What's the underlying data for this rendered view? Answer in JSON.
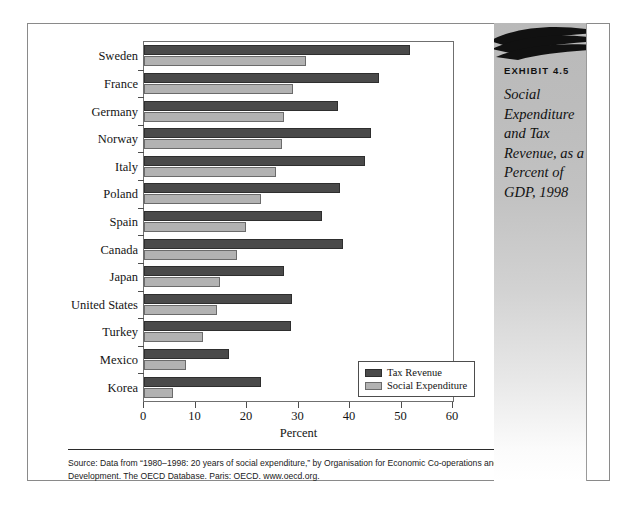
{
  "exhibit": {
    "number": "EXHIBIT 4.5",
    "title": "Social Expenditure and Tax Revenue, as a Percent of GDP, 1998"
  },
  "source": {
    "text": "Source: Data from “1980–1998: 20 years of social expenditure,” by Organisation for Economic Co-operations and Development. The OECD Database. Paris: OECD. www.oecd.org."
  },
  "colors": {
    "tax_revenue": "#4a4a4a",
    "social_expenditure": "#b2b2b2",
    "panel_gray": "#bcbcbc",
    "frame": "#8a8a8a"
  },
  "chart_data": {
    "type": "bar",
    "orientation": "horizontal",
    "title": "Social Expenditure and Tax Revenue, as a Percent of GDP, 1998",
    "xlabel": "Percent",
    "ylabel": "",
    "xlim": [
      0,
      60
    ],
    "xticks": [
      0,
      10,
      20,
      30,
      40,
      50,
      60
    ],
    "grid": false,
    "legend_position": "inside-bottom-right",
    "categories": [
      "Sweden",
      "France",
      "Germany",
      "Norway",
      "Italy",
      "Poland",
      "Spain",
      "Canada",
      "Japan",
      "United States",
      "Turkey",
      "Mexico",
      "Korea"
    ],
    "series": [
      {
        "name": "Tax Revenue",
        "color": "#4a4a4a",
        "values": [
          51.7,
          45.6,
          37.6,
          44.0,
          43.0,
          38.0,
          34.6,
          38.6,
          27.2,
          28.8,
          28.6,
          16.6,
          22.8
        ]
      },
      {
        "name": "Social Expenditure",
        "color": "#b2b2b2",
        "values": [
          31.5,
          29.0,
          27.2,
          26.8,
          25.7,
          22.8,
          19.9,
          18.0,
          14.7,
          14.1,
          11.4,
          8.1,
          5.6
        ]
      }
    ]
  }
}
